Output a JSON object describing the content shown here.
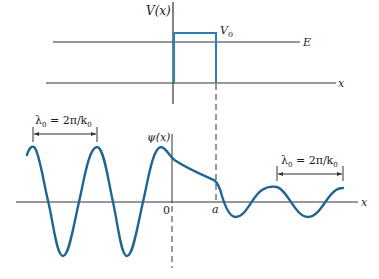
{
  "colors": {
    "axis": "#2a2a2a",
    "curve": "#1f6592",
    "barrier": "#2b7fb8",
    "background": "#ffffff"
  },
  "top_plot": {
    "y_axis_label": "V(x)",
    "barrier_label": "V",
    "barrier_subscript": "0",
    "energy_label": "E",
    "x_axis_label": "x"
  },
  "bottom_plot": {
    "y_axis_label": "ψ(x)",
    "x_axis_label": "x",
    "origin_label": "0",
    "barrier_edge_label": "a",
    "left_wavelength": {
      "lambda": "λ",
      "sub": "0",
      "eq": " = 2π/k",
      "sub2": "0"
    },
    "right_wavelength": {
      "lambda": "λ",
      "sub": "0",
      "eq": " = 2π/k",
      "sub2": "0"
    }
  }
}
